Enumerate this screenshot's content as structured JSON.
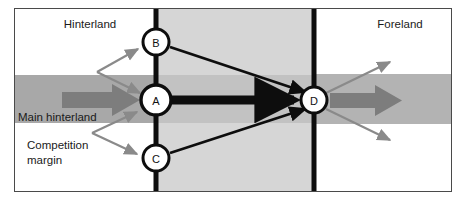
{
  "figure": {
    "type": "diagram",
    "name": "hinterland-foreland-port-competition-diagram",
    "width": 466,
    "height": 200,
    "background_color": "#ffffff"
  },
  "frame": {
    "border_color": "#4a4a4a",
    "border_width": 1,
    "x": 14,
    "y": 8,
    "width": 438,
    "height": 184
  },
  "regions": [
    {
      "key": "hinterland",
      "label": "Hinterland",
      "label_x": 90,
      "label_y": 28,
      "fill": "#ffffff"
    },
    {
      "key": "foreland",
      "label": "Foreland",
      "label_x": 400,
      "label_y": 28,
      "fill": "#ffffff"
    }
  ],
  "bands": {
    "corridor_fill": "#d6d6d6",
    "corridor_x": 156,
    "corridor_width": 158,
    "main_hinterland_fill": "#a8a8a8",
    "left_band_y": 75,
    "left_band_height": 48,
    "right_band_fill": "#b3b3b3",
    "right_band_y": 74,
    "right_band_height": 50
  },
  "axes": [
    {
      "key": "left-axis",
      "x": 156,
      "color": "#0d0d0d",
      "width": 5
    },
    {
      "key": "right-axis",
      "x": 314,
      "color": "#0d0d0d",
      "width": 5
    }
  ],
  "nodes": [
    {
      "key": "node-b",
      "label": "B",
      "cx": 156,
      "cy": 42,
      "r": 13
    },
    {
      "key": "node-a",
      "label": "A",
      "cx": 156,
      "cy": 100,
      "r": 15
    },
    {
      "key": "node-c",
      "label": "C",
      "cx": 156,
      "cy": 158,
      "r": 13
    },
    {
      "key": "node-d",
      "label": "D",
      "cx": 314,
      "cy": 100,
      "r": 13
    }
  ],
  "node_style": {
    "fill": "#ffffff",
    "stroke": "#0d0d0d",
    "stroke_width": 3,
    "label_color": "#111111"
  },
  "annotations": [
    {
      "key": "main-hinterland",
      "lines": [
        "Main hinterland"
      ],
      "x": 18,
      "y": 121
    },
    {
      "key": "competition-margin",
      "lines": [
        "Competition",
        "margin"
      ],
      "x": 27,
      "y": 149
    }
  ],
  "flows": {
    "thick_black": {
      "color": "#0d0d0d",
      "description": "A to D main corridor flow",
      "from": "A",
      "to": "D"
    },
    "thin_black": {
      "color": "#0d0d0d",
      "description": "B to D and C to D feeder flows",
      "from": [
        "B",
        "C"
      ],
      "to": "D"
    },
    "wide_gray_left": {
      "color": "#7d7d7d",
      "description": "Main hinterland inbound flow arrow into A"
    },
    "wide_gray_right": {
      "color": "#7d7d7d",
      "description": "Foreland outbound flow arrow from D"
    },
    "thin_gray": {
      "color": "#8a8a8a",
      "description": "Competition margin splitter arrows to B and C; foreland fan arrows from D"
    }
  },
  "palette": {
    "black": "#0d0d0d",
    "dark_gray": "#7d7d7d",
    "mid_gray": "#8a8a8a",
    "band_gray": "#a8a8a8",
    "corridor_gray": "#d6d6d6",
    "white": "#ffffff",
    "frame_gray": "#4a4a4a"
  }
}
